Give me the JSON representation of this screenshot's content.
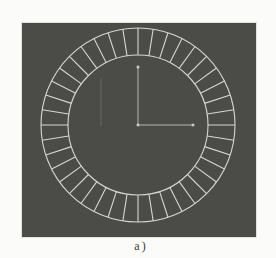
{
  "figure": {
    "caption": "a)",
    "page_background": "#fbfbfa",
    "viewport": {
      "background": "#4b4b48",
      "width": 234,
      "height": 214
    },
    "drawing": {
      "type": "segmented-annular-ring",
      "segments": 40,
      "segment_angle_deg": 9,
      "center": {
        "x": 116,
        "y": 102
      },
      "outer_radius": 97,
      "inner_radius": 70,
      "stroke_color": "#d7d7d1",
      "stroke_width": 1.1,
      "axis": {
        "vertical_length": 58,
        "horizontal_length": 55,
        "color": "#b7b8af",
        "marker_size": 2.6,
        "marker_color": "#cbccc3"
      },
      "faint_line": {
        "x": 79,
        "y1": 55,
        "y2": 103,
        "color": "rgba(205,205,198,0.22)"
      }
    }
  }
}
